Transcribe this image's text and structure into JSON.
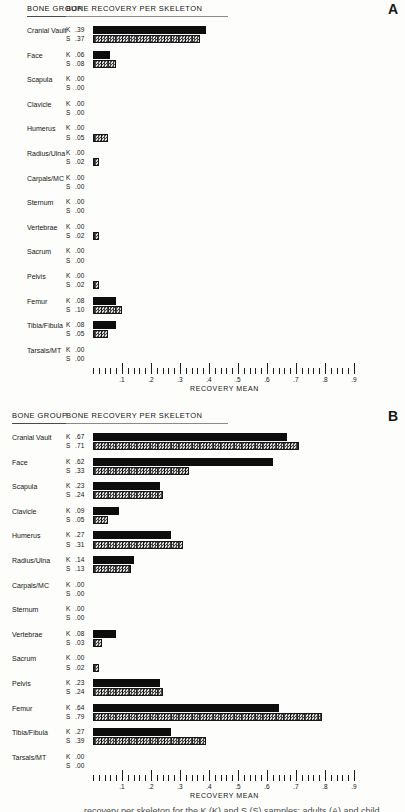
{
  "page_background": "#fdfdfb",
  "panels": [
    {
      "letter": "A",
      "bone_group_header": "BONE GROUP",
      "title": "BONE RECOVERY PER SKELETON"
    },
    {
      "letter": "B",
      "bone_group_header": "BONE GROUP",
      "title": "BONE RECOVERY PER SKELETON"
    }
  ],
  "axis": {
    "xlabel": "RECOVERY MEAN",
    "tick_labels": [
      ".1",
      ".2",
      ".3",
      ".4",
      ".5",
      ".6",
      ".7",
      ".8",
      ".9"
    ],
    "min": 0,
    "max": 0.9,
    "minor_step": 0.02,
    "major_step": 0.1
  },
  "series_names": [
    "K",
    "S"
  ],
  "colors": {
    "k_bar": "#0d0d0d",
    "s_bar_dark": "#454545",
    "s_bar_light": "#d9d9d9",
    "text": "#161616",
    "background": "#fdfdfb"
  },
  "caption_fragment": "recovery per skeleton for the K (K) and S (S) samples: adults (A) and child",
  "chart_data": [
    {
      "type": "bar",
      "orientation": "horizontal",
      "panel": "A",
      "title": "BONE RECOVERY PER SKELETON",
      "xlabel": "RECOVERY MEAN",
      "xlim": [
        0,
        0.9
      ],
      "grid": false,
      "categories": [
        "Cranial Vault",
        "Face",
        "Scapula",
        "Clavicle",
        "Humerus",
        "Radius/Ulna",
        "Carpals/MC",
        "Sternum",
        "Vertebrae",
        "Sacrum",
        "Pelvis",
        "Femur",
        "Tibia/Fibula",
        "Tarsals/MT"
      ],
      "series": [
        {
          "name": "K",
          "values": [
            0.39,
            0.06,
            0.0,
            0.0,
            0.0,
            0.0,
            0.0,
            0.0,
            0.0,
            0.0,
            0.0,
            0.08,
            0.08,
            0.0
          ]
        },
        {
          "name": "S",
          "values": [
            0.37,
            0.08,
            0.0,
            0.0,
            0.05,
            0.02,
            0.0,
            0.0,
            0.02,
            0.0,
            0.02,
            0.1,
            0.05,
            0.0
          ]
        }
      ]
    },
    {
      "type": "bar",
      "orientation": "horizontal",
      "panel": "B",
      "title": "BONE RECOVERY PER SKELETON",
      "xlabel": "RECOVERY MEAN",
      "xlim": [
        0,
        0.9
      ],
      "grid": false,
      "categories": [
        "Cranial Vault",
        "Face",
        "Scapula",
        "Clavicle",
        "Humerus",
        "Radius/Ulna",
        "Carpals/MC",
        "Sternum",
        "Vertebrae",
        "Sacrum",
        "Pelvis",
        "Femur",
        "Tibia/Fibula",
        "Tarsals/MT"
      ],
      "series": [
        {
          "name": "K",
          "values": [
            0.67,
            0.62,
            0.23,
            0.09,
            0.27,
            0.14,
            0.0,
            0.0,
            0.08,
            0.0,
            0.23,
            0.64,
            0.27,
            0.0
          ]
        },
        {
          "name": "S",
          "values": [
            0.71,
            0.33,
            0.24,
            0.05,
            0.31,
            0.13,
            0.0,
            0.0,
            0.03,
            0.02,
            0.24,
            0.79,
            0.39,
            0.0
          ]
        }
      ]
    }
  ]
}
